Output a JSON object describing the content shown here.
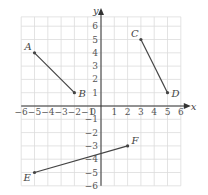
{
  "chart_data": {
    "type": "scatter",
    "title": "",
    "xlabel": "x",
    "ylabel": "y",
    "xlim": [
      -6,
      6
    ],
    "ylim": [
      -6,
      6
    ],
    "grid": true,
    "x_ticks": [
      -6,
      -5,
      -4,
      -3,
      -2,
      -1,
      0,
      1,
      2,
      3,
      4,
      5,
      6
    ],
    "y_ticks": [
      -6,
      -5,
      -4,
      -3,
      -2,
      -1,
      1,
      2,
      3,
      4,
      5,
      6
    ],
    "origin_label": "0",
    "points": [
      {
        "label": "A",
        "x": -5,
        "y": 4
      },
      {
        "label": "B",
        "x": -2,
        "y": 1
      },
      {
        "label": "C",
        "x": 3,
        "y": 5
      },
      {
        "label": "D",
        "x": 5,
        "y": 1
      },
      {
        "label": "E",
        "x": -5,
        "y": -5
      },
      {
        "label": "F",
        "x": 2,
        "y": -3
      }
    ],
    "segments": [
      {
        "from": "A",
        "to": "B"
      },
      {
        "from": "C",
        "to": "D"
      },
      {
        "from": "E",
        "to": "F"
      }
    ]
  },
  "colors": {
    "grid": "#dcdcdc",
    "axis": "#333333",
    "segment": "#444444",
    "text": "#555555"
  }
}
